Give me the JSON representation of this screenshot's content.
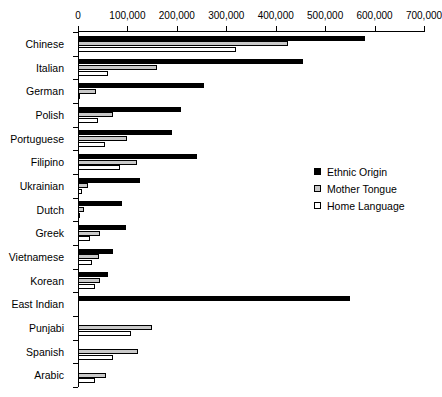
{
  "chart_data": {
    "type": "bar",
    "orientation": "horizontal",
    "title": "",
    "xlabel": "",
    "ylabel": "",
    "xlim": [
      0,
      700000
    ],
    "xticks": [
      0,
      100000,
      200000,
      300000,
      400000,
      500000,
      600000,
      700000
    ],
    "xticklabels": [
      "0",
      "100,000",
      "200,000",
      "300,000",
      "400,000",
      "500,000",
      "600,000",
      "700,000"
    ],
    "grid": false,
    "legend_position": "center-right",
    "categories": [
      "Chinese",
      "Italian",
      "German",
      "Polish",
      "Portuguese",
      "Filipino",
      "Ukrainian",
      "Dutch",
      "Greek",
      "Vietnamese",
      "Korean",
      "East Indian",
      "Punjabi",
      "Spanish",
      "Arabic"
    ],
    "series": [
      {
        "name": "Ethnic Origin",
        "color": "#000000",
        "values": [
          580000,
          455000,
          255000,
          208000,
          190000,
          240000,
          125000,
          90000,
          98000,
          70000,
          60000,
          550000,
          0,
          0,
          0
        ]
      },
      {
        "name": "Mother Tongue",
        "color": "#c9c9c9",
        "values": [
          425000,
          160000,
          37000,
          70000,
          100000,
          120000,
          20000,
          12000,
          45000,
          42000,
          45000,
          0,
          150000,
          122000,
          57000
        ]
      },
      {
        "name": "Home Language",
        "color": "#ffffff",
        "values": [
          320000,
          60000,
          5000,
          40000,
          55000,
          85000,
          8000,
          5000,
          25000,
          29000,
          35000,
          0,
          107000,
          70000,
          35000
        ]
      }
    ]
  },
  "legend": {
    "items": [
      {
        "label": "Ethnic Origin",
        "swatch": "ethnic"
      },
      {
        "label": "Mother Tongue",
        "swatch": "mother"
      },
      {
        "label": "Home Language",
        "swatch": "home"
      }
    ]
  }
}
